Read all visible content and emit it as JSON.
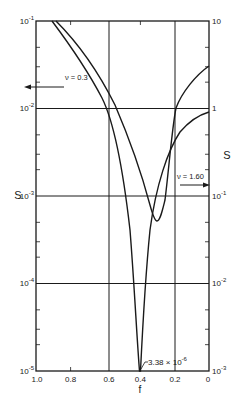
{
  "chart_data": {
    "type": "line",
    "title": "",
    "xlabel": "f",
    "ylabel_left": "S",
    "ylabel_right": "S",
    "x_reversed": true,
    "xlim": [
      1.0,
      0
    ],
    "x_ticks": [
      "1.0",
      "0.8",
      "0.6",
      "0.4",
      "0.2",
      "0"
    ],
    "y_left_scale": "log",
    "ylim_left": [
      1e-05,
      0.1
    ],
    "y_left_ticks": [
      "10^-5",
      "10^-4",
      "10^-3",
      "10^-2",
      "10^-1"
    ],
    "y_right_scale": "log",
    "ylim_right": [
      0.001,
      10
    ],
    "y_right_ticks": [
      "10^-3",
      "10^-2",
      "10^-1",
      "1",
      "10"
    ],
    "grid": {
      "horizontal_at_decades": true,
      "vertical_at_f": [
        0.6,
        0.2
      ]
    },
    "series": [
      {
        "name": "ν = 0.3",
        "axis": "left",
        "x": [
          0.91,
          0.8,
          0.7,
          0.6,
          0.5,
          0.45,
          0.42,
          0.4,
          0.38,
          0.35,
          0.3,
          0.2,
          0.1,
          0.0
        ],
        "values": [
          0.1,
          0.04,
          0.016,
          0.01,
          0.002,
          0.0004,
          5e-05,
          3.38e-06,
          5e-05,
          0.0005,
          0.002,
          0.008,
          0.02,
          0.03
        ]
      },
      {
        "name": "ν = 1.60",
        "axis": "right",
        "x": [
          0.88,
          0.8,
          0.7,
          0.6,
          0.5,
          0.4,
          0.35,
          0.3,
          0.25,
          0.2,
          0.1,
          0.0
        ],
        "values": [
          10,
          6,
          2.5,
          1.3,
          0.4,
          0.12,
          0.07,
          0.05,
          0.2,
          1.0,
          2.0,
          3.0
        ]
      }
    ],
    "annotations": [
      {
        "text": "ν = 0.3",
        "arrow": "left",
        "meaning": "refers to left axis"
      },
      {
        "text": "ν = 1.60",
        "arrow": "right",
        "meaning": "refers to right axis"
      },
      {
        "text": "3.38 × 10^-6",
        "at_f": 0.4,
        "meaning": "minimum value of ν=0.3 curve"
      }
    ]
  },
  "labels": {
    "x_axis": "f",
    "y_left": "S",
    "y_right": "S",
    "nu_low": "ν = 0.3",
    "nu_high": "ν = 1.60",
    "min_value": "3.38 × 10",
    "min_exp": "-6"
  },
  "x_tick_labels": [
    "1.0",
    "0.8",
    "0.6",
    "0.4",
    "0.2",
    "0"
  ],
  "y_left_labels": [
    {
      "base": "10",
      "exp": "-1"
    },
    {
      "base": "10",
      "exp": "-2"
    },
    {
      "base": "10",
      "exp": "-3"
    },
    {
      "base": "10",
      "exp": "-4"
    },
    {
      "base": "10",
      "exp": "-5"
    }
  ],
  "y_right_labels": [
    {
      "base": "10",
      "exp": ""
    },
    {
      "base": "1",
      "exp": ""
    },
    {
      "base": "10",
      "exp": "-1"
    },
    {
      "base": "10",
      "exp": "-2"
    },
    {
      "base": "10",
      "exp": "-3"
    }
  ]
}
